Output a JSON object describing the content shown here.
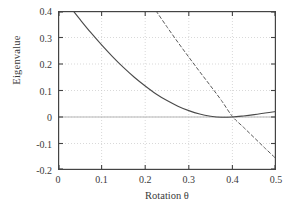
{
  "chart_data": {
    "type": "line",
    "title": "",
    "xlabel": "Rotation θ",
    "ylabel": "Eigenvalue",
    "xlim": [
      0,
      0.5
    ],
    "ylim": [
      -0.2,
      0.4
    ],
    "xticks": [
      "0",
      "0.1",
      "0.2",
      "0.3",
      "0.4",
      "0.5"
    ],
    "xtick_values": [
      0,
      0.1,
      0.2,
      0.3,
      0.4,
      0.5
    ],
    "yticks": [
      "0.4",
      "0.3",
      "0.2",
      "0.1",
      "0",
      "-0.1",
      "-0.2"
    ],
    "ytick_values": [
      0.4,
      0.3,
      0.2,
      0.1,
      0,
      -0.1,
      -0.2
    ],
    "grid": true,
    "grid_style": "dotted",
    "legend": null,
    "frame": true,
    "series": [
      {
        "name": "solid-eigenvalue-branch",
        "style": "solid",
        "color": "#4a4a4a",
        "x": [
          0.035,
          0.05,
          0.075,
          0.1,
          0.125,
          0.15,
          0.175,
          0.2,
          0.225,
          0.25,
          0.275,
          0.3,
          0.325,
          0.35,
          0.375,
          0.4,
          0.425,
          0.45,
          0.475,
          0.5
        ],
        "y": [
          0.4,
          0.369,
          0.319,
          0.272,
          0.228,
          0.187,
          0.15,
          0.117,
          0.087,
          0.062,
          0.041,
          0.024,
          0.011,
          0.003,
          -0.001,
          0.0,
          0.004,
          0.009,
          0.015,
          0.021
        ]
      },
      {
        "name": "dashed-eigenvalue-branch",
        "style": "dashed",
        "color": "#5a5a5a",
        "x": [
          0.225,
          0.25,
          0.275,
          0.3,
          0.325,
          0.35,
          0.375,
          0.4,
          0.425,
          0.45,
          0.475,
          0.5
        ],
        "y": [
          0.4,
          0.34,
          0.282,
          0.226,
          0.171,
          0.117,
          0.062,
          0.002,
          -0.038,
          -0.078,
          -0.118,
          -0.157
        ]
      }
    ],
    "annotations": [
      {
        "text": "curves intersect near θ = 0.40, eigenvalue = 0"
      }
    ]
  },
  "colors": {
    "frame": "#444444",
    "grid": "#c9c9c9",
    "zero_line": "#b5b5b5",
    "text": "#3a3a3a",
    "background": "#ffffff"
  }
}
